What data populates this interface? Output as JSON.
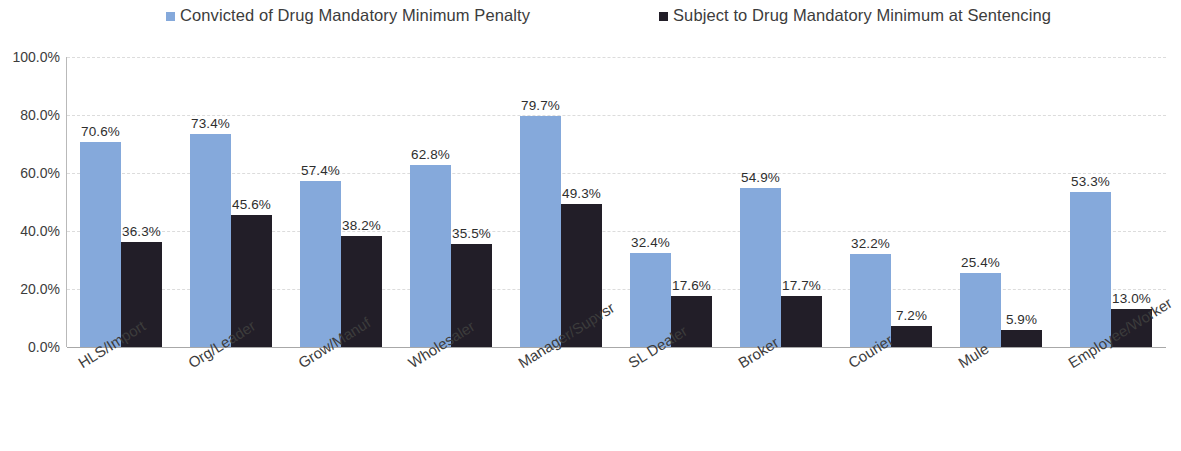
{
  "chart_data": {
    "type": "bar",
    "title": "",
    "subtitle": "",
    "xlabel": "",
    "ylabel": "",
    "ylim": [
      0,
      100
    ],
    "ytick_labels": [
      "100.0%",
      "80.0%",
      "60.0%",
      "40.0%",
      "20.0%",
      "0.0%"
    ],
    "ytick_values": [
      100,
      80,
      60,
      40,
      20,
      0
    ],
    "grid": true,
    "grid_style": "horizontal-dashed",
    "legend_position": "top",
    "orientation": "vertical",
    "grouping": "grouped",
    "value_label_format": "percent-one-decimal",
    "categories": [
      "HLS/Import",
      "Org/Leader",
      "Grow/Manuf",
      "Wholesaler",
      "Manager/Supvsr",
      "SL Dealer",
      "Broker",
      "Courier",
      "Mule",
      "Employee/Worker"
    ],
    "series": [
      {
        "name": "Convicted of Drug Mandatory Minimum Penalty",
        "color": "#85A9DB",
        "values": [
          70.6,
          73.4,
          57.4,
          62.8,
          79.7,
          32.4,
          54.9,
          32.2,
          25.4,
          53.3
        ],
        "labels": [
          "70.6%",
          "73.4%",
          "57.4%",
          "62.8%",
          "79.7%",
          "32.4%",
          "54.9%",
          "32.2%",
          "25.4%",
          "53.3%"
        ]
      },
      {
        "name": "Subject to Drug Mandatory Minimum at Sentencing",
        "color": "#221E28",
        "values": [
          36.3,
          45.6,
          38.2,
          35.5,
          49.3,
          17.6,
          17.7,
          7.2,
          5.9,
          13.0
        ],
        "labels": [
          "36.3%",
          "45.6%",
          "38.2%",
          "35.5%",
          "49.3%",
          "17.6%",
          "17.7%",
          "7.2%",
          "5.9%",
          "13.0%"
        ]
      }
    ]
  },
  "legend": {
    "items": [
      {
        "label": "Convicted of Drug Mandatory Minimum Penalty",
        "color": "#85A9DB",
        "marker": "square-marker"
      },
      {
        "label": "Subject to Drug Mandatory Minimum at Sentencing",
        "color": "#221E28",
        "marker": "square-marker"
      }
    ]
  },
  "colors": {
    "series_1": "#85A9DB",
    "series_2": "#221E28",
    "gridline": "#DCDCDC",
    "axis": "#A8A8A8",
    "text": "#3C3C3C",
    "background": "#FFFFFF"
  }
}
